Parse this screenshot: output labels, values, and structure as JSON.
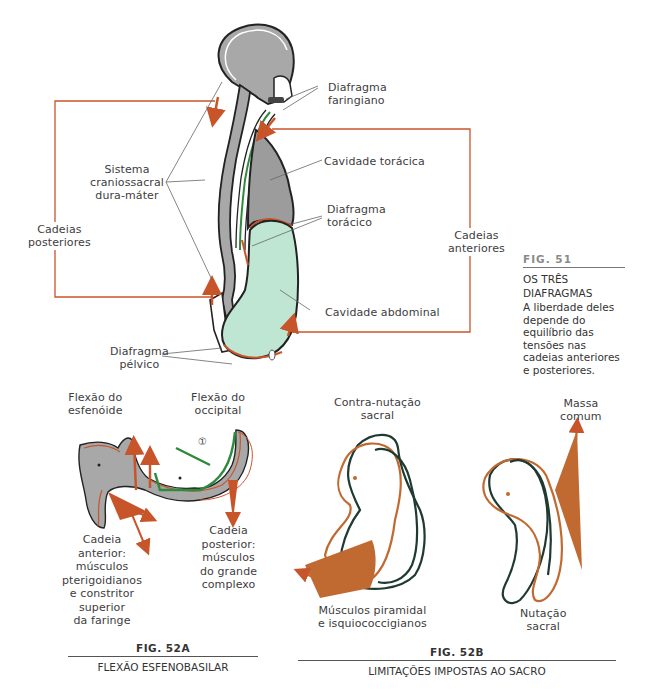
{
  "colors": {
    "orange": "#c8552a",
    "sacrum_orange": "#c06a32",
    "bone_gray": "#a3a3a3",
    "cavity_green": "#bfe6d2",
    "dura_green": "#2f8a3e",
    "outline_dark": "#222222",
    "sacrum_dark": "#1f3a30"
  },
  "fig51": {
    "number": "FIG. 51",
    "title": "OS TRÊS\nDIAFRAGMAS",
    "description": "A liberdade deles\ndepende do\nequilíbrio das\ntensões nas\ncadeias anteriores\ne posteriores.",
    "labels": {
      "diafragma_faringiano": "Diafragma\nfaringiano",
      "cavidade_toracica": "Cavidade torácica",
      "diafragma_toracico": "Diafragma\ntorácico",
      "cadeias_anteriores": "Cadeias\nanteriores",
      "cavidade_abdominal": "Cavidade abdominal",
      "sistema_craniossacral": "Sistema\ncraniossacral\ndura-máter",
      "cadeias_posteriores": "Cadeias\nposteriores",
      "diafragma_pelvico": "Diafragma\npélvico"
    }
  },
  "fig52a": {
    "number": "FIG. 52A",
    "title": "FLEXÃO ESFENOBASILAR",
    "labels": {
      "flexao_esfenoide": "Flexão do\nesfenóide",
      "flexao_occipital": "Flexão do\noccipital",
      "marker": "①",
      "cadeia_anterior": "Cadeia\nanterior:\nmúsculos\npterigoidianos\ne constritor\nsuperior\nda faringe",
      "cadeia_posterior": "Cadeia\nposterior:\nmúsculos\ndo grande\ncomplexo"
    }
  },
  "fig52b": {
    "number": "FIG. 52B",
    "title": "LIMITAÇÕES IMPOSTAS AO SACRO",
    "labels": {
      "contra_nutacao": "Contra-nutação\nsacral",
      "massa_comum": "Massa\ncomum",
      "musculos_piramidal": "Músculos piramidal\ne isquiococcigianos",
      "nutacao_sacral": "Nutação\nsacral"
    }
  }
}
